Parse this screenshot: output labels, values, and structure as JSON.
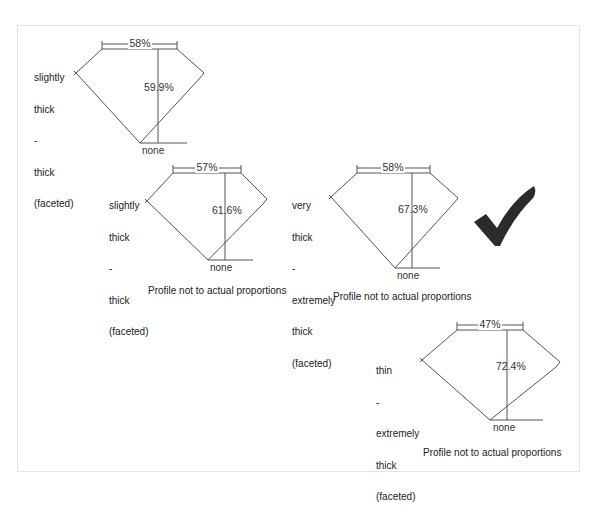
{
  "diagram": {
    "profiles": [
      {
        "id": "profile-1",
        "table_pct": "58%",
        "depth_pct": "59.9%",
        "culet": "none",
        "girdle_label": [
          "slightly",
          "thick",
          "-",
          "thick",
          "(faceted)"
        ],
        "caption": ""
      },
      {
        "id": "profile-2",
        "table_pct": "57%",
        "depth_pct": "61.6%",
        "culet": "none",
        "girdle_label": [
          "slightly",
          "thick",
          "-",
          "thick",
          "(faceted)"
        ],
        "caption": "Profile not to actual proportions"
      },
      {
        "id": "profile-3",
        "table_pct": "58%",
        "depth_pct": "67.3%",
        "culet": "none",
        "girdle_label": [
          "very",
          "thick",
          "-",
          "extremely",
          "thick",
          "(faceted)"
        ],
        "caption": "Profile not to actual proportions"
      },
      {
        "id": "profile-4",
        "table_pct": "47%",
        "depth_pct": "72.4%",
        "culet": "none",
        "girdle_label": [
          "thin",
          "-",
          "extremely",
          "thick",
          "(faceted)"
        ],
        "caption": "Profile not to actual proportions"
      }
    ],
    "checkmark": {
      "icon": "checkmark-icon",
      "color": "#2b2b2b"
    },
    "colors": {
      "line": "#555555",
      "text": "#222222",
      "frame": "#e4e4e4"
    }
  }
}
